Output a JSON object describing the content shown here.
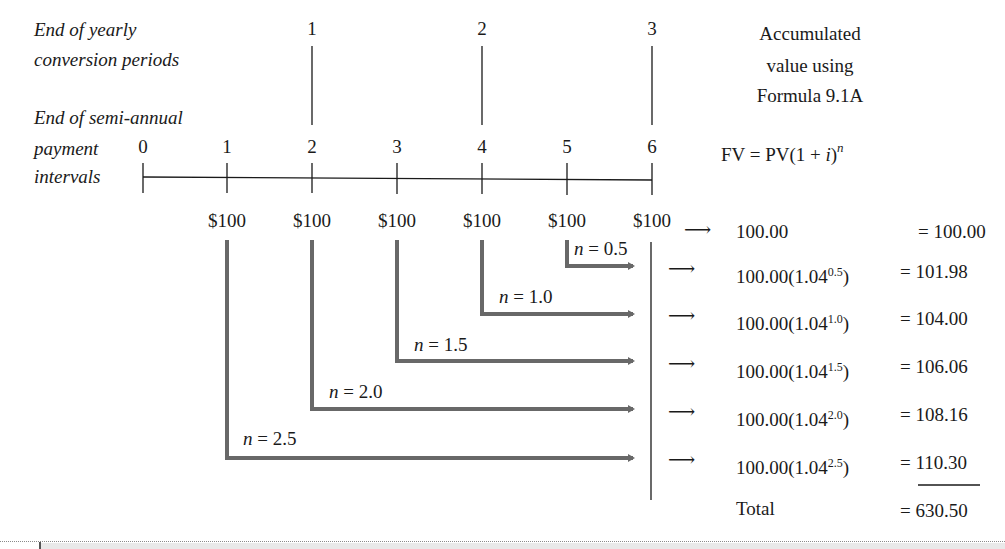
{
  "labels": {
    "yearly_line1": "End of yearly",
    "yearly_line2": "conversion periods",
    "semi_line1": "End of semi-annual",
    "semi_line2": "payment",
    "semi_line3": "intervals",
    "header_line1": "Accumulated",
    "header_line2": "value using",
    "header_line3": "Formula 9.1A",
    "formula_main": "FV = PV(1 + ",
    "formula_i": "i",
    "formula_close": ")",
    "formula_exp": "n"
  },
  "yearly_ticks": [
    "1",
    "2",
    "3"
  ],
  "interval_ticks": [
    "0",
    "1",
    "2",
    "3",
    "4",
    "5",
    "6"
  ],
  "payments": [
    "$100",
    "$100",
    "$100",
    "$100",
    "$100",
    "$100"
  ],
  "n_labels": [
    {
      "var": "n",
      "eq": " = 0.5"
    },
    {
      "var": "n",
      "eq": " = 1.0"
    },
    {
      "var": "n",
      "eq": " = 1.5"
    },
    {
      "var": "n",
      "eq": " = 2.0"
    },
    {
      "var": "n",
      "eq": " = 2.5"
    }
  ],
  "rows": [
    {
      "expr": "100.00",
      "exp": "",
      "close": "",
      "eq": "= 100.00"
    },
    {
      "expr": "100.00(1.04",
      "exp": "0.5",
      "close": ")",
      "eq": "= 101.98"
    },
    {
      "expr": "100.00(1.04",
      "exp": "1.0",
      "close": ")",
      "eq": "= 104.00"
    },
    {
      "expr": "100.00(1.04",
      "exp": "1.5",
      "close": ")",
      "eq": "= 106.06"
    },
    {
      "expr": "100.00(1.04",
      "exp": "2.0",
      "close": ")",
      "eq": "= 108.16"
    },
    {
      "expr": "100.00(1.04",
      "exp": "2.5",
      "close": ")",
      "eq": "= 110.30"
    }
  ],
  "total": {
    "label": "Total",
    "eq_sign": "= ",
    "value": "630.50"
  },
  "arrow_glyph": "⟶",
  "colors": {
    "ink": "#1a1a1a",
    "flow_gray": "#686868"
  }
}
